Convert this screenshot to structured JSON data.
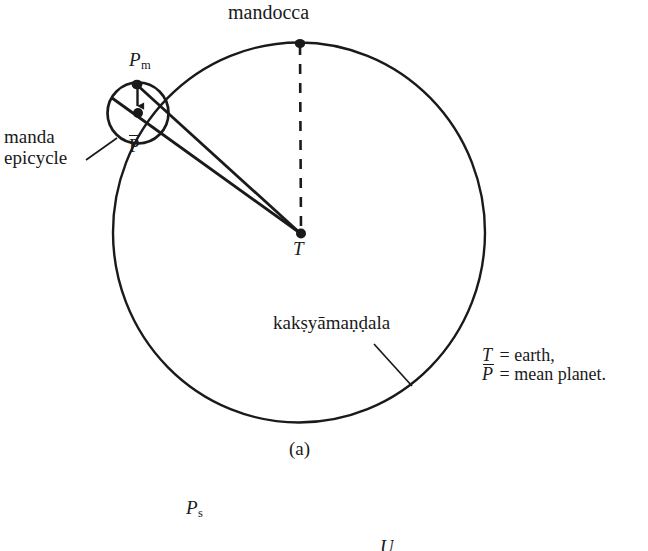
{
  "figure": {
    "caption": "(a)",
    "labels": {
      "mandocca": "mandocca",
      "p_m_base": "P",
      "p_m_sub": "m",
      "p_bar": "P",
      "manda_line1": "manda",
      "manda_line2": "epicycle",
      "earth_point": "T",
      "kaksyamandala": "kakṣyāmaṇḍala"
    },
    "legend": {
      "row1_symbol": "T",
      "row1_text": "= earth,",
      "row2_symbol": "P",
      "row2_text": "= mean planet."
    },
    "next_figure": {
      "p_s_base": "P",
      "p_s_sub": "s",
      "u_label": "U"
    }
  },
  "geometry": {
    "deferent": {
      "cx": 299,
      "cy": 232,
      "r": 190
    },
    "epicycle": {
      "cx": 138,
      "cy": 113,
      "r": 30
    },
    "mandocca_point": {
      "x": 300,
      "y": 43
    },
    "earth_point": {
      "x": 301,
      "y": 234
    },
    "p_m_point": {
      "x": 137,
      "y": 84
    },
    "p_bar_point": {
      "x": 138,
      "y": 113
    },
    "stroke_color": "#1a1a1a"
  }
}
